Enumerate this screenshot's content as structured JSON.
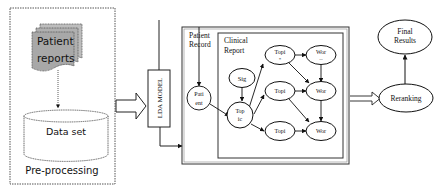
{
  "preprocessing": {
    "title": "Pre-processing",
    "patient_reports_line1": "Patient",
    "patient_reports_line2": "reports",
    "dataset": "Data set"
  },
  "lda_model": {
    "label": "LDA MODEL"
  },
  "patient_record": {
    "label_line1": "Patient",
    "label_line2": "Record",
    "patient_node_line1": "Pati",
    "patient_node_line2": "ent"
  },
  "clinical_report": {
    "label_line1": "Clinical",
    "label_line2": "Report",
    "nodes": {
      "sig": "Sig",
      "top_line1": "Top",
      "top_line2": "ic",
      "topi_1_line1": "Topi",
      "topi_1_line2": "*",
      "topi_2": "Topi",
      "topi_3": "Topi",
      "wor_1_line1": "Wor",
      "wor_1_line2": "--",
      "wor_2": "Wor",
      "wor_3": "Wor"
    }
  },
  "reranking": {
    "label": "Reranking"
  },
  "final_results": {
    "label_line1": "Final",
    "label_line2": "Results"
  },
  "colors": {
    "stroke": "#222222",
    "doc_fill": "#a8a8a8",
    "dotted": "#555555"
  }
}
